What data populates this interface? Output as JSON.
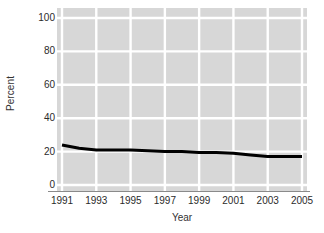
{
  "chart_data": {
    "type": "line",
    "title": "",
    "xlabel": "Year",
    "ylabel": "Percent",
    "x": [
      1991,
      1992,
      1993,
      1994,
      1995,
      1996,
      1997,
      1998,
      1999,
      2000,
      2001,
      2002,
      2003,
      2004,
      2005
    ],
    "values": [
      24,
      22,
      21,
      21,
      21,
      20.5,
      20,
      20,
      19.5,
      19.5,
      19,
      18,
      17,
      17,
      17
    ],
    "series": [
      {
        "name": "Percent",
        "values": [
          24,
          22,
          21,
          21,
          21,
          20.5,
          20,
          20,
          19.5,
          19.5,
          19,
          18,
          17,
          17,
          17
        ]
      }
    ],
    "xlim": [
      1991,
      2005
    ],
    "ylim": [
      0,
      100
    ],
    "ytick_labels": [
      "0",
      "20",
      "40",
      "60",
      "80",
      "100"
    ],
    "ytick_values": [
      0,
      20,
      40,
      60,
      80,
      100
    ],
    "xtick_labels": [
      "1991",
      "1993",
      "1995",
      "1997",
      "1999",
      "2001",
      "2003",
      "2005"
    ],
    "xtick_values": [
      1991,
      1993,
      1995,
      1997,
      1999,
      2001,
      2003,
      2005
    ],
    "grid": true,
    "grid_color": "#ffffff",
    "plot_background": "#d7d7d7",
    "line_color": "#000000",
    "line_width": 3,
    "legend": "none"
  },
  "axes": {
    "y_title": "Percent",
    "x_title": "Year"
  }
}
